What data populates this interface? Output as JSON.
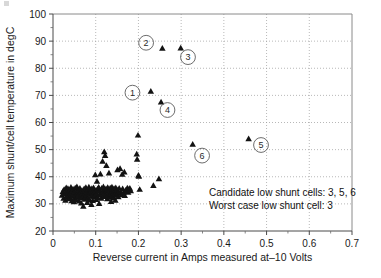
{
  "chart_data": {
    "type": "scatter",
    "title": "",
    "xlabel": "Reverse current in Amps measured at–10 Volts",
    "ylabel": "Maximum shunt/cell temperature in degC",
    "xlim": [
      0,
      0.7
    ],
    "ylim": [
      20,
      100
    ],
    "xticks": [
      "0",
      "0.1",
      "0.2",
      "0.3",
      "0.4",
      "0.5",
      "0.6",
      "0.7"
    ],
    "xtick_values": [
      0,
      0.1,
      0.2,
      0.3,
      0.4,
      0.5,
      0.6,
      0.7
    ],
    "yticks": [
      "20",
      "30",
      "40",
      "50",
      "60",
      "70",
      "80",
      "90",
      "100"
    ],
    "ytick_values": [
      20,
      30,
      40,
      50,
      60,
      70,
      80,
      90,
      100
    ],
    "xminor_step": 0.05,
    "yminor_step": 5,
    "grid": "both",
    "legend": "none",
    "marker": "triangle-up",
    "marker_color": "#131313",
    "series": [
      {
        "name": "shunt cells",
        "points": [
          [
            0.021,
            33.2
          ],
          [
            0.023,
            34.6
          ],
          [
            0.025,
            32.1
          ],
          [
            0.026,
            35.4
          ],
          [
            0.028,
            33.8
          ],
          [
            0.029,
            31.4
          ],
          [
            0.03,
            34.2
          ],
          [
            0.031,
            36.0
          ],
          [
            0.032,
            32.7
          ],
          [
            0.033,
            34.9
          ],
          [
            0.034,
            33.1
          ],
          [
            0.035,
            35.7
          ],
          [
            0.036,
            31.9
          ],
          [
            0.037,
            34.4
          ],
          [
            0.038,
            33.5
          ],
          [
            0.039,
            35.1
          ],
          [
            0.04,
            32.4
          ],
          [
            0.041,
            34.0
          ],
          [
            0.042,
            36.2
          ],
          [
            0.043,
            33.3
          ],
          [
            0.044,
            31.2
          ],
          [
            0.045,
            34.8
          ],
          [
            0.046,
            32.9
          ],
          [
            0.047,
            35.5
          ],
          [
            0.048,
            33.7
          ],
          [
            0.049,
            30.8
          ],
          [
            0.05,
            34.3
          ],
          [
            0.051,
            32.2
          ],
          [
            0.052,
            35.9
          ],
          [
            0.053,
            33.4
          ],
          [
            0.054,
            31.6
          ],
          [
            0.055,
            34.7
          ],
          [
            0.056,
            36.4
          ],
          [
            0.057,
            32.6
          ],
          [
            0.058,
            34.1
          ],
          [
            0.059,
            33.0
          ],
          [
            0.06,
            35.3
          ],
          [
            0.061,
            31.1
          ],
          [
            0.062,
            33.9
          ],
          [
            0.063,
            35.8
          ],
          [
            0.064,
            32.3
          ],
          [
            0.065,
            34.5
          ],
          [
            0.066,
            30.4
          ],
          [
            0.067,
            33.6
          ],
          [
            0.068,
            35.0
          ],
          [
            0.069,
            32.8
          ],
          [
            0.07,
            34.2
          ],
          [
            0.071,
            29.2
          ],
          [
            0.072,
            33.1
          ],
          [
            0.073,
            35.6
          ],
          [
            0.074,
            31.8
          ],
          [
            0.075,
            34.9
          ],
          [
            0.076,
            32.5
          ],
          [
            0.077,
            36.1
          ],
          [
            0.078,
            33.3
          ],
          [
            0.079,
            34.6
          ],
          [
            0.08,
            30.6
          ],
          [
            0.081,
            35.2
          ],
          [
            0.082,
            32.0
          ],
          [
            0.083,
            34.0
          ],
          [
            0.084,
            36.3
          ],
          [
            0.085,
            33.8
          ],
          [
            0.086,
            31.5
          ],
          [
            0.087,
            35.4
          ],
          [
            0.088,
            34.3
          ],
          [
            0.089,
            32.9
          ],
          [
            0.09,
            29.8
          ],
          [
            0.091,
            35.7
          ],
          [
            0.092,
            33.5
          ],
          [
            0.093,
            31.3
          ],
          [
            0.094,
            34.8
          ],
          [
            0.095,
            36.0
          ],
          [
            0.096,
            32.7
          ],
          [
            0.097,
            34.4
          ],
          [
            0.098,
            33.2
          ],
          [
            0.099,
            40.8
          ],
          [
            0.1,
            35.0
          ],
          [
            0.101,
            31.7
          ],
          [
            0.102,
            33.9
          ],
          [
            0.103,
            38.4
          ],
          [
            0.104,
            35.5
          ],
          [
            0.105,
            32.4
          ],
          [
            0.106,
            34.7
          ],
          [
            0.107,
            36.2
          ],
          [
            0.108,
            30.2
          ],
          [
            0.109,
            33.4
          ],
          [
            0.11,
            35.1
          ],
          [
            0.111,
            41.1
          ],
          [
            0.112,
            34.0
          ],
          [
            0.113,
            32.1
          ],
          [
            0.114,
            35.8
          ],
          [
            0.115,
            33.7
          ],
          [
            0.116,
            45.8
          ],
          [
            0.117,
            34.5
          ],
          [
            0.118,
            36.4
          ],
          [
            0.119,
            32.8
          ],
          [
            0.12,
            49.3
          ],
          [
            0.121,
            34.2
          ],
          [
            0.122,
            47.9
          ],
          [
            0.123,
            33.1
          ],
          [
            0.124,
            35.6
          ],
          [
            0.125,
            44.2
          ],
          [
            0.126,
            34.9
          ],
          [
            0.127,
            31.9
          ],
          [
            0.128,
            36.1
          ],
          [
            0.129,
            33.3
          ],
          [
            0.13,
            35.2
          ],
          [
            0.131,
            41.4
          ],
          [
            0.132,
            34.6
          ],
          [
            0.133,
            32.5
          ],
          [
            0.134,
            35.9
          ],
          [
            0.135,
            33.8
          ],
          [
            0.136,
            30.9
          ],
          [
            0.137,
            34.3
          ],
          [
            0.138,
            36.3
          ],
          [
            0.139,
            33.0
          ],
          [
            0.14,
            35.4
          ],
          [
            0.141,
            34.1
          ],
          [
            0.142,
            32.2
          ],
          [
            0.143,
            35.7
          ],
          [
            0.144,
            33.6
          ],
          [
            0.145,
            34.8
          ],
          [
            0.146,
            31.4
          ],
          [
            0.147,
            36.0
          ],
          [
            0.148,
            34.4
          ],
          [
            0.149,
            33.2
          ],
          [
            0.15,
            35.3
          ],
          [
            0.151,
            42.6
          ],
          [
            0.152,
            34.0
          ],
          [
            0.153,
            32.7
          ],
          [
            0.155,
            35.8
          ],
          [
            0.157,
            43.1
          ],
          [
            0.158,
            34.5
          ],
          [
            0.16,
            33.4
          ],
          [
            0.162,
            41.0
          ],
          [
            0.163,
            35.6
          ],
          [
            0.165,
            34.2
          ],
          [
            0.167,
            41.8
          ],
          [
            0.168,
            33.1
          ],
          [
            0.17,
            35.1
          ],
          [
            0.172,
            34.7
          ],
          [
            0.174,
            35.9
          ],
          [
            0.176,
            34.3
          ],
          [
            0.178,
            35.5
          ],
          [
            0.18,
            35.8
          ],
          [
            0.182,
            34.9
          ],
          [
            0.196,
            48.4
          ],
          [
            0.197,
            46.5
          ],
          [
            0.199,
            55.4
          ],
          [
            0.2,
            40.6
          ],
          [
            0.201,
            40.2
          ],
          [
            0.203,
            35.4
          ],
          [
            0.229,
            71.6
          ],
          [
            0.235,
            36.8
          ],
          [
            0.248,
            39.3
          ],
          [
            0.253,
            67.6
          ],
          [
            0.256,
            87.4
          ],
          [
            0.299,
            87.5
          ],
          [
            0.327,
            52.0
          ],
          [
            0.458,
            54.1
          ]
        ]
      }
    ],
    "callouts": [
      {
        "label": "1",
        "cx": 0.186,
        "cy": 71.0
      },
      {
        "label": "2",
        "cx": 0.218,
        "cy": 89.4
      },
      {
        "label": "3",
        "cx": 0.316,
        "cy": 84.1
      },
      {
        "label": "4",
        "cx": 0.268,
        "cy": 64.6
      },
      {
        "label": "5",
        "cx": 0.487,
        "cy": 51.7
      },
      {
        "label": "6",
        "cx": 0.349,
        "cy": 47.8
      }
    ],
    "annotations": [
      "Candidate low shunt cells: 3, 5, 6",
      "Worst case low shunt cell: 3"
    ]
  }
}
